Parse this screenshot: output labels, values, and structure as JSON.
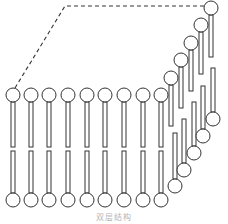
{
  "diagram": {
    "caption": "双层结构",
    "stroke_color": "#333333",
    "fill_color": "#ffffff",
    "head_radius": 7,
    "tail_width": 4,
    "flat_bilayer": {
      "lipid_count": 9,
      "head_x": [
        13,
        31,
        49,
        68,
        87,
        105,
        124,
        143,
        161
      ],
      "top_head_y": 95,
      "top_tail": [
        102,
        147
      ],
      "bottom_head_y": 200,
      "bottom_tail": [
        151,
        193
      ]
    },
    "curved_top_leaflet": [
      {
        "hx": 171,
        "hy": 78,
        "ty1": 85,
        "ty2": 126
      },
      {
        "hx": 181,
        "hy": 60,
        "ty1": 67,
        "ty2": 108
      },
      {
        "hx": 191,
        "hy": 43,
        "ty1": 50,
        "ty2": 91
      },
      {
        "hx": 201,
        "hy": 25,
        "ty1": 32,
        "ty2": 74
      },
      {
        "hx": 211,
        "hy": 8,
        "ty1": 15,
        "ty2": 57
      }
    ],
    "curved_bottom_leaflet": [
      {
        "hx": 175,
        "hy": 186,
        "ty1": 133,
        "ty2": 179
      },
      {
        "hx": 184,
        "hy": 170,
        "ty1": 119,
        "ty2": 163
      },
      {
        "hx": 194,
        "hy": 153,
        "ty1": 102,
        "ty2": 146
      },
      {
        "hx": 203,
        "hy": 136,
        "ty1": 86,
        "ty2": 129
      },
      {
        "hx": 213,
        "hy": 119,
        "ty1": 68,
        "ty2": 112
      }
    ],
    "dashed_outline": [
      [
        15,
        88
      ],
      [
        65,
        6
      ],
      [
        205,
        6
      ]
    ]
  }
}
